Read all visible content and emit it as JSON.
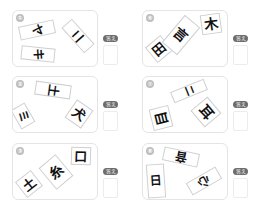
{
  "answer_label": "答え",
  "puzzles": [
    {
      "number": "①",
      "pieces": [
        "ヤ",
        "ニ",
        "キ"
      ]
    },
    {
      "number": "②",
      "pieces": [
        "土",
        "ミ",
        "犬"
      ]
    },
    {
      "number": "③",
      "pieces": [
        "土",
        "糸",
        "口"
      ]
    },
    {
      "number": "⑥",
      "pieces": [
        "田",
        "言",
        "木"
      ]
    },
    {
      "number": "⑦",
      "pieces": [
        "ニ",
        "目",
        "耳"
      ]
    },
    {
      "number": "⑧",
      "pieces": [
        "日",
        "音",
        "心"
      ]
    }
  ]
}
